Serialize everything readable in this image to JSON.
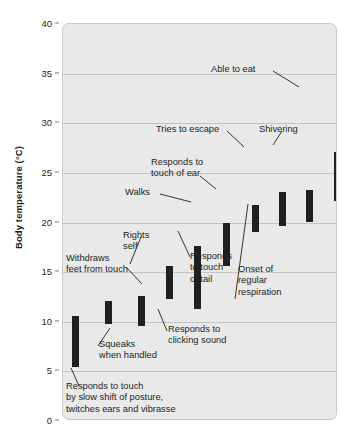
{
  "chart_data": {
    "type": "bar",
    "title": "",
    "xlabel": "",
    "ylabel": "Body temperature (°C)",
    "ylim": [
      0,
      40
    ],
    "yticks": [
      0,
      5,
      10,
      15,
      20,
      25,
      30,
      35,
      40
    ],
    "grid": true,
    "legend": "none",
    "note": "Floating range bars: each bar spans the body-temperature range over which the behaviour is observed during arousal from hibernation.",
    "categories": [
      "Responds to touch by slow shift of posture, twitches ears and vibrasse",
      "Squeaks when handled",
      "Withdraws feet from touch",
      "Rights self",
      "Responds to clicking sound",
      "Responds to touch of tail",
      "Walks",
      "Responds to touch of ear",
      "Onset of regular respiration",
      "Tries to escape",
      "Shivering",
      "Able to eat"
    ],
    "bars": [
      {
        "label": "Responds to touch by slow shift of posture, twitches ears and vibrasse",
        "low": 5.4,
        "high": 10.6
      },
      {
        "label": "Squeaks when handled",
        "low": 9.8,
        "high": 12.1
      },
      {
        "label": "Withdraws feet from touch",
        "low": 9.6,
        "high": 12.6
      },
      {
        "label": "Rights self",
        "low": 12.3,
        "high": 15.6
      },
      {
        "label": "Responds to clicking sound",
        "low": 11.3,
        "high": 17.6
      },
      {
        "label": "Responds to touch of tail",
        "low": 15.6,
        "high": 19.9
      },
      {
        "label": "Walks",
        "low": 19.0,
        "high": 21.8
      },
      {
        "label": "Responds to touch of ear",
        "low": 19.6,
        "high": 23.1
      },
      {
        "label": "Onset of regular respiration",
        "low": 20.0,
        "high": 23.3
      },
      {
        "label": "Tries to escape",
        "low": 22.2,
        "high": 27.1
      },
      {
        "label": "Shivering",
        "low": 17.9,
        "high": 27.2
      },
      {
        "label": "Able to eat",
        "low": 22.8,
        "high": 33.3
      }
    ]
  },
  "annotations": {
    "able_to_eat": "Able to eat",
    "tries_to_escape": "Tries to escape",
    "shivering": "Shivering",
    "responds_touch_ear": "Responds to\ntouch of ear",
    "walks": "Walks",
    "rights_self": "Rights\nself",
    "withdraws_feet": "Withdraws\nfeet from touch",
    "responds_touch_tail": "Responds\nto touch\nof  tail",
    "onset_respiration": "Onset of\nregular\nrespiration",
    "responds_clicking": "Responds to\nclicking sound",
    "squeaks": "Squeaks\nwhen handled",
    "responds_touch_posture": "Responds to touch\nby slow shift of posture,\ntwitches ears and vibrasse"
  },
  "axis": {
    "y_title": "Body temperature (°C)",
    "tick_labels": [
      "40",
      "35",
      "30",
      "25",
      "20",
      "15",
      "10",
      "5",
      "0"
    ]
  },
  "colors": {
    "bar": "#231f20",
    "plot_background": "#e9e9e9",
    "gridline": "#c4c4c4",
    "text": "#231f20",
    "page_background": "#ffffff"
  }
}
